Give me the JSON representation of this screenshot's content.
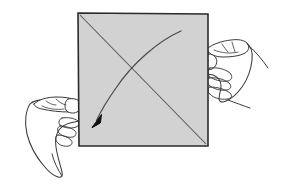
{
  "figure": {
    "background_color": "#ffffff",
    "width": 290,
    "height": 188
  },
  "paper": {
    "name": "square-sheet",
    "shape": "square",
    "fill_color": "#d2d2d2",
    "edge_color": "#2b2b2b",
    "edge_width": 1.6,
    "corners": {
      "top_left": [
        78,
        13
      ],
      "top_right": [
        208,
        14
      ],
      "bottom_right": [
        208,
        146
      ],
      "bottom_left": [
        79,
        146
      ]
    }
  },
  "crease": {
    "name": "diagonal-crease-line",
    "description": "diagonal crease from top-left corner to bottom-right corner",
    "color": "#555555",
    "from": [
      80,
      15
    ],
    "to": [
      206,
      144
    ]
  },
  "fold_arrow": {
    "name": "fold-direction-arrow",
    "description": "curved arrow indicating top-right corner folds down to bottom-left",
    "line_color": "#4a4a4a",
    "head_color": "#111111",
    "start": [
      181,
      31
    ],
    "end": [
      95,
      123
    ],
    "head_angle_deg": 225
  },
  "hands": [
    {
      "name": "left-hand",
      "side": "left",
      "description": "left hand gripping the left edge of the sheet with thumb on front",
      "outline_color": "#3a3a3a",
      "fill_color": "#ffffff",
      "grip_point": [
        79,
        112
      ]
    },
    {
      "name": "right-hand",
      "side": "right",
      "description": "right hand gripping the right edge of the sheet with thumb on front",
      "outline_color": "#3a3a3a",
      "fill_color": "#ffffff",
      "grip_point": [
        208,
        60
      ]
    }
  ],
  "labels": {
    "visible_text": []
  }
}
